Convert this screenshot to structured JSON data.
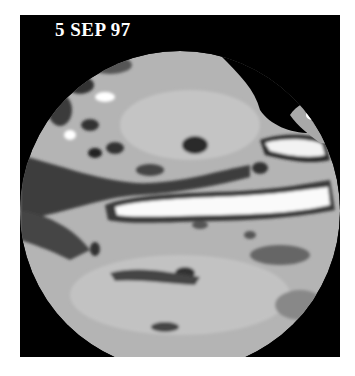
{
  "image": {
    "title": "5 SEP 97",
    "subject": "globe-pacific-ocean-sea-surface-height",
    "colors": {
      "frame": "#000000",
      "background": "#ffffff",
      "ocean_mid": "#b4b4b4",
      "ocean_light": "#d2d2d2",
      "ocean_dark": "#555555",
      "anomaly_high": "#f8f8f8",
      "land": "#000000",
      "title_text": "#ffffff"
    }
  }
}
